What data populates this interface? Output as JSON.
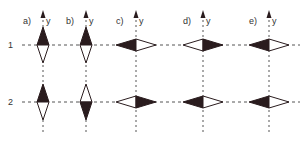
{
  "diagram": {
    "rows": [
      {
        "label": "1",
        "y": 45
      },
      {
        "label": "2",
        "y": 102
      }
    ],
    "columns": [
      {
        "label": "a)",
        "axis_label": "y",
        "x": 43,
        "cells": [
          {
            "orient": "vertical",
            "filled": "top"
          },
          {
            "orient": "vertical",
            "filled": "top"
          }
        ]
      },
      {
        "label": "b)",
        "axis_label": "y",
        "x": 86,
        "cells": [
          {
            "orient": "vertical",
            "filled": "top"
          },
          {
            "orient": "vertical",
            "filled": "bottom"
          }
        ]
      },
      {
        "label": "c)",
        "axis_label": "y",
        "x": 136,
        "cells": [
          {
            "orient": "horizontal",
            "filled": "left"
          },
          {
            "orient": "horizontal",
            "filled": "right"
          }
        ]
      },
      {
        "label": "d)",
        "axis_label": "y",
        "x": 203,
        "cells": [
          {
            "orient": "horizontal",
            "filled": "right"
          },
          {
            "orient": "horizontal",
            "filled": "left"
          }
        ]
      },
      {
        "label": "e)",
        "axis_label": "y",
        "x": 269,
        "cells": [
          {
            "orient": "horizontal",
            "filled": "left"
          },
          {
            "orient": "horizontal",
            "filled": "left"
          }
        ]
      }
    ],
    "colors": {
      "fill": "#2a1c1e",
      "stroke": "#2a1c1e",
      "line": "#555555"
    }
  }
}
